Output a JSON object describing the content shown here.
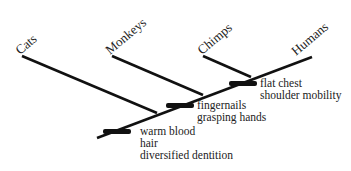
{
  "diagram": {
    "type": "cladogram",
    "taxa": [
      {
        "label": "Cats"
      },
      {
        "label": "Monkeys"
      },
      {
        "label": "Chimps"
      },
      {
        "label": "Humans"
      }
    ],
    "synapomorphies": [
      {
        "lines": [
          "warm blood",
          "hair",
          "diversified dentition"
        ]
      },
      {
        "lines": [
          "fingernails",
          "grasping hands"
        ]
      },
      {
        "lines": [
          "flat chest",
          "shoulder mobility"
        ]
      }
    ],
    "colors": {
      "line": "#111111",
      "text": "#222222",
      "background": "#ffffff"
    }
  }
}
